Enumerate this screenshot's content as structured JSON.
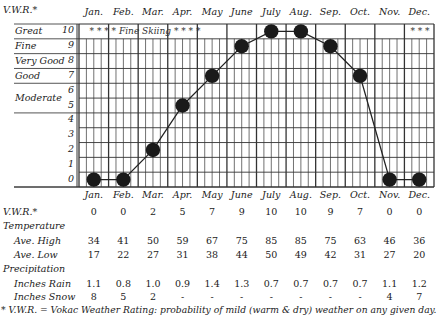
{
  "chart_data": {
    "type": "line",
    "title": "",
    "xlabel": "",
    "ylabel": "V.W.R.*",
    "ylim": [
      0,
      10
    ],
    "grid": true,
    "categories": [
      "Jan.",
      "Feb.",
      "Mar.",
      "Apr.",
      "May",
      "June",
      "July",
      "Aug.",
      "Sep.",
      "Oct.",
      "Nov.",
      "Dec."
    ],
    "series": [
      {
        "name": "V.W.R.",
        "values": [
          0,
          0,
          2,
          5,
          7,
          9,
          10,
          10,
          9,
          7,
          0,
          0
        ]
      }
    ],
    "y_tick_labels": [
      "0",
      "1",
      "2",
      "3",
      "4",
      "5",
      "6",
      "7",
      "8",
      "9",
      "10"
    ],
    "rating_bands": [
      {
        "label": "Great",
        "values": [
          10
        ]
      },
      {
        "label": "Fine",
        "values": [
          9
        ]
      },
      {
        "label": "Very Good",
        "values": [
          8
        ]
      },
      {
        "label": "Good",
        "values": [
          7
        ]
      },
      {
        "label": "Moderate",
        "values": [
          6,
          5
        ]
      }
    ],
    "annotations": [
      {
        "text": "* * * * Fine Skiing * * * *",
        "months": [
          "Jan.",
          "Feb.",
          "Mar.",
          "Apr."
        ]
      },
      {
        "text": "* * *",
        "months": [
          "Dec."
        ]
      }
    ]
  },
  "header": {
    "vwr_label": "V.W.R.*",
    "months": [
      "Jan.",
      "Feb.",
      "Mar.",
      "Apr.",
      "May",
      "June",
      "July",
      "Aug.",
      "Sep.",
      "Oct.",
      "Nov.",
      "Dec."
    ]
  },
  "table": {
    "vwr": {
      "label": "V.W.R.*",
      "values": [
        "0",
        "0",
        "2",
        "5",
        "7",
        "9",
        "10",
        "10",
        "9",
        "7",
        "0",
        "0"
      ]
    },
    "temperature_heading": "Temperature",
    "ave_high": {
      "label": "Ave. High",
      "values": [
        "34",
        "41",
        "50",
        "59",
        "67",
        "75",
        "85",
        "85",
        "75",
        "63",
        "46",
        "36"
      ]
    },
    "ave_low": {
      "label": "Ave. Low",
      "values": [
        "17",
        "22",
        "27",
        "31",
        "38",
        "44",
        "50",
        "49",
        "42",
        "31",
        "27",
        "20"
      ]
    },
    "precipitation_heading": "Precipitation",
    "inches_rain": {
      "label": "Inches Rain",
      "values": [
        "1.1",
        "0.8",
        "1.0",
        "0.9",
        "1.4",
        "1.3",
        "0.7",
        "0.7",
        "0.7",
        "0.7",
        "1.1",
        "1.2"
      ]
    },
    "inches_snow": {
      "label": "Inches Snow",
      "values": [
        "8",
        "5",
        "2",
        "-",
        "-",
        "-",
        "-",
        "-",
        "-",
        "-",
        "4",
        "7"
      ]
    }
  },
  "footnote": "* V.W.R. = Vokac Weather Rating: probability of mild (warm & dry) weather on any given day."
}
